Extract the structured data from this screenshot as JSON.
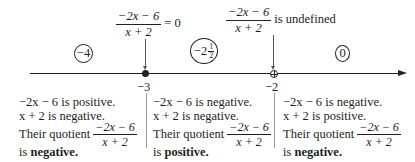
{
  "annotations": {
    "zero": {
      "numerator": "−2x − 6",
      "denominator": "x + 2",
      "suffix": "= 0"
    },
    "undefined": {
      "numerator": "−2x − 6",
      "denominator": "x + 2",
      "suffix": "is undefined"
    }
  },
  "test_points": [
    {
      "label": "−4"
    },
    {
      "label": "−2",
      "frac_num": "1",
      "frac_den": "2"
    },
    {
      "label": "0"
    }
  ],
  "axis": {
    "ticks": [
      {
        "label": "−3",
        "marker": "filled-dot"
      },
      {
        "label": "−2",
        "marker": "open-crossed-circle"
      }
    ]
  },
  "intervals": [
    {
      "line1": "−2x − 6 is positive.",
      "line2": "x + 2 is negative.",
      "prefix": "Their quotient",
      "frac_num": "−2x − 6",
      "frac_den": "x + 2",
      "conclusion_prefix": "is",
      "conclusion": "negative."
    },
    {
      "line1": "−2x − 6 is negative.",
      "line2": "x + 2 is negative.",
      "prefix": "Their quotient",
      "frac_num": "−2x − 6",
      "frac_den": "x + 2",
      "conclusion_prefix": "is",
      "conclusion": "positive."
    },
    {
      "line1": "−2x − 6 is negative.",
      "line2": "x + 2 is positive.",
      "prefix": "Their quotient",
      "frac_num": "−2x − 6",
      "frac_den": "x + 2",
      "conclusion_prefix": "is",
      "conclusion": "negative."
    }
  ]
}
